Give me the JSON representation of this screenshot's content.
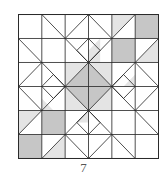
{
  "figure": {
    "grid_size": 6,
    "colors": {
      "dark": "#c6c6c6",
      "light": "#e4e4e4",
      "line": "#2a2a2a",
      "background": "#ffffff"
    },
    "dark_polygons": [
      [
        [
          2,
          3
        ],
        [
          3,
          2
        ],
        [
          4,
          3
        ],
        [
          3,
          4
        ]
      ],
      [
        [
          5,
          0
        ],
        [
          6,
          0
        ],
        [
          6,
          1
        ],
        [
          5,
          1
        ]
      ],
      [
        [
          4,
          1
        ],
        [
          5,
          1
        ],
        [
          5,
          2
        ],
        [
          4,
          2
        ]
      ],
      [
        [
          1,
          4
        ],
        [
          2,
          4
        ],
        [
          2,
          5
        ],
        [
          1,
          5
        ]
      ],
      [
        [
          0,
          5
        ],
        [
          1,
          5
        ],
        [
          1,
          6
        ],
        [
          0,
          6
        ]
      ]
    ],
    "light_polygons": [
      [
        [
          4,
          0
        ],
        [
          5,
          0
        ],
        [
          4,
          1
        ]
      ],
      [
        [
          2,
          2
        ],
        [
          3,
          2
        ],
        [
          2,
          3
        ]
      ],
      [
        [
          3,
          2
        ],
        [
          4,
          2
        ],
        [
          4,
          3
        ]
      ],
      [
        [
          2,
          3
        ],
        [
          2,
          4
        ],
        [
          3,
          4
        ]
      ],
      [
        [
          4,
          3
        ],
        [
          4,
          4
        ],
        [
          3,
          4
        ]
      ],
      [
        [
          3,
          1.5
        ],
        [
          3.5,
          1
        ],
        [
          3.5,
          2
        ],
        [
          3,
          2
        ]
      ],
      [
        [
          6,
          1
        ],
        [
          6,
          2
        ],
        [
          5,
          2
        ]
      ],
      [
        [
          0,
          4
        ],
        [
          1,
          4
        ],
        [
          0,
          5
        ]
      ],
      [
        [
          1,
          6
        ],
        [
          2,
          6
        ],
        [
          2,
          5
        ]
      ],
      [
        [
          1,
          3.5
        ],
        [
          1.5,
          4
        ],
        [
          1,
          4
        ]
      ],
      [
        [
          4.5,
          3
        ],
        [
          5,
          3
        ],
        [
          5,
          2.5
        ]
      ],
      [
        [
          2.5,
          4.5
        ],
        [
          3,
          4.5
        ],
        [
          3,
          4
        ]
      ]
    ],
    "lines": [
      [
        [
          0,
          1
        ],
        [
          6,
          1
        ]
      ],
      [
        [
          0,
          2
        ],
        [
          6,
          2
        ]
      ],
      [
        [
          0,
          3
        ],
        [
          6,
          3
        ]
      ],
      [
        [
          0,
          4
        ],
        [
          6,
          4
        ]
      ],
      [
        [
          0,
          5
        ],
        [
          6,
          5
        ]
      ],
      [
        [
          1,
          0
        ],
        [
          1,
          6
        ]
      ],
      [
        [
          2,
          0
        ],
        [
          2,
          6
        ]
      ],
      [
        [
          3,
          0
        ],
        [
          3,
          6
        ]
      ],
      [
        [
          4,
          0
        ],
        [
          4,
          6
        ]
      ],
      [
        [
          5,
          0
        ],
        [
          5,
          6
        ]
      ],
      [
        [
          1,
          0
        ],
        [
          2,
          1
        ]
      ],
      [
        [
          2,
          1
        ],
        [
          3,
          0
        ]
      ],
      [
        [
          3,
          0
        ],
        [
          4,
          1
        ]
      ],
      [
        [
          4,
          1
        ],
        [
          5,
          0
        ]
      ],
      [
        [
          2,
          1
        ],
        [
          3,
          2
        ]
      ],
      [
        [
          4,
          1
        ],
        [
          3,
          2
        ]
      ],
      [
        [
          3,
          1
        ],
        [
          2.5,
          1.5
        ]
      ],
      [
        [
          3,
          1
        ],
        [
          3.5,
          1.5
        ]
      ],
      [
        [
          2.5,
          1.5
        ],
        [
          3,
          2
        ]
      ],
      [
        [
          3.5,
          1.5
        ],
        [
          3,
          2
        ]
      ],
      [
        [
          2,
          3
        ],
        [
          3,
          2
        ]
      ],
      [
        [
          3,
          2
        ],
        [
          4,
          3
        ]
      ],
      [
        [
          4,
          3
        ],
        [
          3,
          4
        ]
      ],
      [
        [
          3,
          4
        ],
        [
          2,
          3
        ]
      ],
      [
        [
          0,
          1
        ],
        [
          1,
          2
        ]
      ],
      [
        [
          1,
          2
        ],
        [
          0,
          3
        ]
      ],
      [
        [
          0,
          3
        ],
        [
          1,
          4
        ]
      ],
      [
        [
          1,
          4
        ],
        [
          0,
          5
        ]
      ],
      [
        [
          1,
          2
        ],
        [
          2,
          3
        ]
      ],
      [
        [
          1,
          4
        ],
        [
          2,
          3
        ]
      ],
      [
        [
          1,
          3
        ],
        [
          1.5,
          2.5
        ]
      ],
      [
        [
          1,
          3
        ],
        [
          1.5,
          3.5
        ]
      ],
      [
        [
          1.5,
          2.5
        ],
        [
          2,
          3
        ]
      ],
      [
        [
          1.5,
          3.5
        ],
        [
          2,
          3
        ]
      ],
      [
        [
          6,
          1
        ],
        [
          5,
          2
        ]
      ],
      [
        [
          5,
          2
        ],
        [
          6,
          3
        ]
      ],
      [
        [
          6,
          3
        ],
        [
          5,
          4
        ]
      ],
      [
        [
          5,
          4
        ],
        [
          6,
          5
        ]
      ],
      [
        [
          5,
          2
        ],
        [
          4,
          3
        ]
      ],
      [
        [
          5,
          4
        ],
        [
          4,
          3
        ]
      ],
      [
        [
          5,
          3
        ],
        [
          4.5,
          2.5
        ]
      ],
      [
        [
          5,
          3
        ],
        [
          4.5,
          3.5
        ]
      ],
      [
        [
          4.5,
          2.5
        ],
        [
          4,
          3
        ]
      ],
      [
        [
          4.5,
          3.5
        ],
        [
          4,
          3
        ]
      ],
      [
        [
          1,
          6
        ],
        [
          2,
          5
        ]
      ],
      [
        [
          2,
          5
        ],
        [
          3,
          6
        ]
      ],
      [
        [
          3,
          6
        ],
        [
          4,
          5
        ]
      ],
      [
        [
          4,
          5
        ],
        [
          5,
          6
        ]
      ],
      [
        [
          2,
          5
        ],
        [
          3,
          4
        ]
      ],
      [
        [
          4,
          5
        ],
        [
          3,
          4
        ]
      ],
      [
        [
          3,
          5
        ],
        [
          2.5,
          4.5
        ]
      ],
      [
        [
          3,
          5
        ],
        [
          3.5,
          4.5
        ]
      ],
      [
        [
          2.5,
          4.5
        ],
        [
          3,
          4
        ]
      ],
      [
        [
          3.5,
          4.5
        ],
        [
          3,
          4
        ]
      ]
    ]
  },
  "caption": "7"
}
